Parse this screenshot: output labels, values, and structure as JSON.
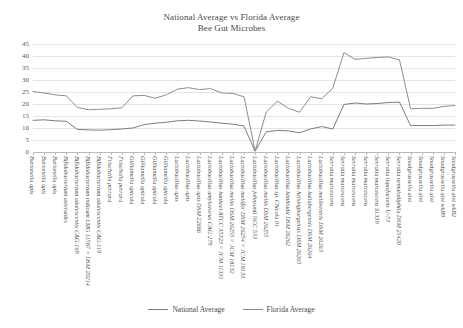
{
  "chart_data": {
    "type": "line",
    "title": "National Average vs Florida Average",
    "subtitle": "Bee Gut Microbes",
    "xlabel": "",
    "ylabel": "",
    "ylim": [
      0,
      45
    ],
    "yticks": [
      0,
      5,
      10,
      15,
      20,
      25,
      30,
      35,
      40,
      45
    ],
    "grid": true,
    "legend_position": "bottom-center",
    "categories": [
      "Bartonella apis",
      "Bartonella apis",
      "Bartonella apis",
      "Bifidobacterium asteroides",
      "Bifidobacterium adolescentis CAG:169",
      "Bifidobacterium indicum LMG 11587 = DSM 20214",
      "Bifidobacterium adolescentis CAG:119",
      "Frischella perrara",
      "Frischella perrara",
      "Gilliamella apicola",
      "Gilliamella apicola",
      "Gilliamella apicola",
      "Gilliamella apicola",
      "Lactobacillus apis",
      "Lactobacillus apis",
      "Lactobacillus apis DSM 22686",
      "Lactobacillus amylovorus CAG:279",
      "Lactobacillus kunkeei ATCC 35323 = JCM 11331",
      "Lactobacillus mellis DSM 26255 = JCM 18132",
      "Lactobacillus mellifer DSM 26254 = JCM 18133",
      "Lactobacillus johnsonii NCC 533",
      "Lactobacillus mellis DSM 26255",
      "Lactobacillus sp. Chicola 01",
      "Lactobacillus kimbladii DSM 26262",
      "Lactobacillus helsingborgensis DSM 26265",
      "Lactobacillus kullabergensis DSM 26264",
      "Lactobacillus melliventris DSM 26263",
      "Serratia marcescens",
      "Serratia marcescens",
      "Serratia marcescens",
      "Serratia marcescens",
      "Serratia marcescens S1339",
      "Serratia liquefaciens U-73",
      "Serratia nematodiphila DSM 21420",
      "Snodgrassella alvi",
      "Snodgrassella alvi",
      "Snodgrassella alvi",
      "Snodgrassella alvi wkB9",
      "Snodgrassella alvi wkB2"
    ],
    "series": [
      {
        "name": "National Average",
        "color": "#7c7c7c",
        "values": [
          13.2,
          13.4,
          13.0,
          12.8,
          9.4,
          9.2,
          9.1,
          9.3,
          9.6,
          10.0,
          11.4,
          12.0,
          12.4,
          13.0,
          13.2,
          12.9,
          12.5,
          12.0,
          11.6,
          10.8,
          0.3,
          8.4,
          9.0,
          8.8,
          8.0,
          9.6,
          10.6,
          9.6,
          19.8,
          20.4,
          20.0,
          20.2,
          20.6,
          20.8,
          11.0,
          11.0,
          11.0,
          11.2,
          11.2
        ]
      },
      {
        "name": "Florida Average",
        "color": "#8d8d8d",
        "values": [
          25.2,
          24.6,
          23.8,
          23.4,
          18.6,
          17.6,
          17.8,
          18.0,
          18.4,
          23.4,
          23.6,
          22.4,
          23.8,
          26.2,
          26.8,
          26.0,
          26.4,
          24.6,
          24.4,
          23.0,
          0.4,
          16.6,
          21.2,
          18.2,
          16.6,
          23.0,
          22.2,
          26.6,
          41.4,
          38.6,
          39.0,
          39.4,
          39.6,
          38.4,
          18.0,
          18.2,
          18.2,
          19.0,
          19.4
        ]
      }
    ]
  },
  "legend": {
    "items": [
      {
        "label": "National Average",
        "color": "#7c7c7c"
      },
      {
        "label": "Florida Average",
        "color": "#8d8d8d"
      }
    ]
  }
}
